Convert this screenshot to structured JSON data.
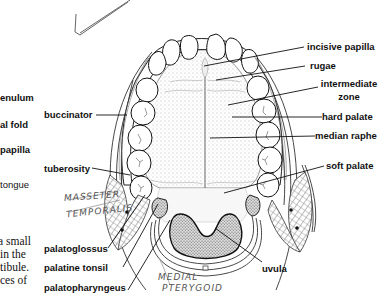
{
  "figure": {
    "right_labels": {
      "incisive_papilla": "incisive papilla",
      "rugae": "rugae",
      "intermediate_zone_1": "intermediate",
      "intermediate_zone_2": "zone",
      "hard_palate": "hard palate",
      "median_raphe": "median raphe",
      "soft_palate": "soft palate"
    },
    "left_labels": {
      "buccinator": "buccinator",
      "tuberosity": "tuberosity",
      "palatoglossus": "palatoglossus",
      "palatine_tonsil": "palatine tonsil",
      "palatopharyngeus": "palatopharyngeus"
    },
    "bottom_labels": {
      "uvula": "uvula"
    },
    "handwritten": {
      "masseter": "MASSETER",
      "temporalis": "TEMPORALIS",
      "medial_1": "MEDIAL",
      "medial_2": "PTERYGOID"
    }
  },
  "cutoff_left_column": {
    "labels": [
      "enulum",
      "al fold",
      "papilla"
    ],
    "plain": "tongue",
    "paragraph": [
      "a small",
      "in the",
      "tibule.",
      "ces of"
    ]
  }
}
